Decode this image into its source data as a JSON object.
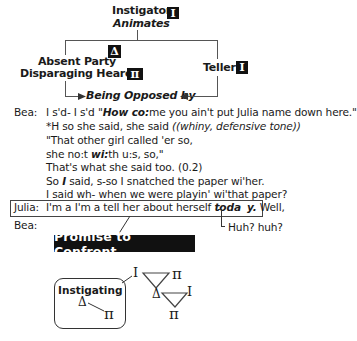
{
  "diagram": {
    "top": {
      "instigator_label": "Instigator",
      "instigator_symbol": "I",
      "animates_label": "Animates",
      "absent_party_label": "Absent Party",
      "absent_party_symbol": "Δ",
      "disparaging_hearer_label": "Disparaging Hearer",
      "disparaging_hearer_symbol": "π",
      "teller_label": "Teller",
      "teller_symbol": "I",
      "being_opposed_label": "Being Opposed by"
    },
    "transcript": {
      "lines": [
        {
          "speaker": "Bea:",
          "pre": "I s'd- I s'd \"",
          "bold_italic": "How co:",
          "post": "me you ain't put Julia name down here.\""
        },
        {
          "speaker": "",
          "pre": "*H so she said, she said ",
          "italic": "((whiny, defensive tone))",
          "post": ""
        },
        {
          "speaker": "",
          "pre": "\"That other girl called 'er so,",
          "post": ""
        },
        {
          "speaker": "",
          "pre": "she no:t ",
          "bold_italic": "wi:",
          "post": "th u:s, so,\""
        },
        {
          "speaker": "",
          "pre": "That's what she said too. (0.2)",
          "post": ""
        },
        {
          "speaker": "",
          "pre": "So ",
          "bold_italic": "I",
          "post": " said, s-so I snatched the paper wi'her."
        },
        {
          "speaker": "",
          "pre": "I said wh- when we  were playin' wi'that paper?",
          "post": ""
        }
      ],
      "julia_line": {
        "speaker": "Julia:",
        "pre": "I'm a I'm a tell her about herself ",
        "bold_italic_1": "toda",
        "bold_italic_2": "y.",
        "post": " Well,"
      },
      "bea_reply": {
        "speaker": "Bea:",
        "text": "Huh? huh?"
      }
    },
    "bottom": {
      "promise_label": "Promise to Confront",
      "instigating_label": "Instigating",
      "symbols": {
        "delta": "Δ",
        "pi": "π",
        "instigator": "I"
      }
    }
  },
  "colors": {
    "text": "#1a1a1a",
    "box_fill": "#111111",
    "box_text": "#ffffff",
    "lines": "#555555"
  }
}
